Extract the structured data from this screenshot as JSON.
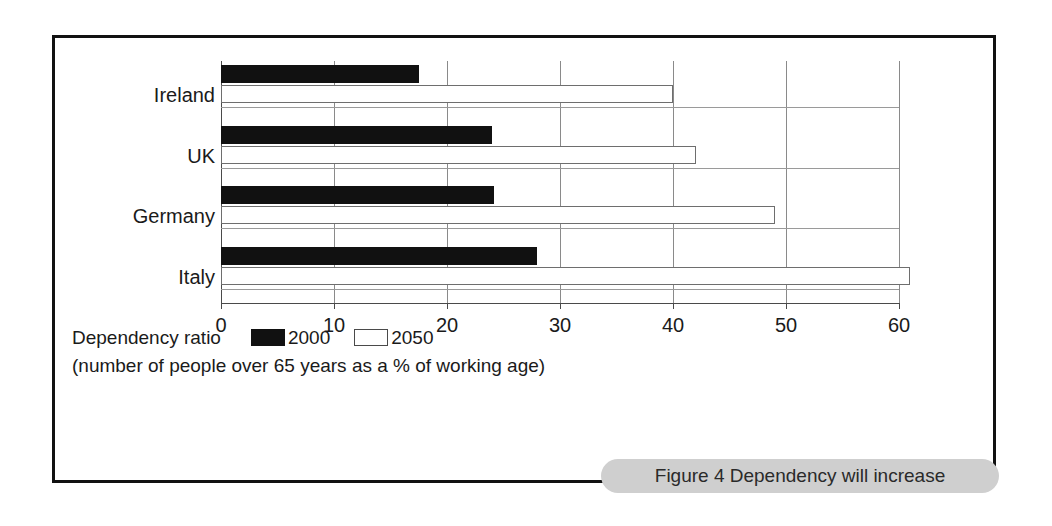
{
  "figure": {
    "caption": "Figure 4 Dependency will increase",
    "frame_color": "#111111",
    "caption_pill_color": "#cfcfcf"
  },
  "legend": {
    "title": "Dependency ratio",
    "note": "(number of people over 65 years as a % of working age)",
    "entries": [
      {
        "label": "2000",
        "swatch": "filled-black-swatch",
        "color": "#111111"
      },
      {
        "label": "2050",
        "swatch": "hollow-white-swatch",
        "color": "#ffffff"
      }
    ]
  },
  "chart_data": {
    "type": "bar",
    "orientation": "horizontal",
    "title": "Figure 4 Dependency will increase",
    "xlabel": "",
    "ylabel": "",
    "categories": [
      "Ireland",
      "UK",
      "Germany",
      "Italy"
    ],
    "series": [
      {
        "name": "2000",
        "color": "#111111",
        "values": [
          17.5,
          24,
          24.2,
          28
        ]
      },
      {
        "name": "2050",
        "color": "#ffffff",
        "values": [
          40,
          42,
          49,
          61
        ]
      }
    ],
    "xlim": [
      0,
      60
    ],
    "xticks": [
      0,
      10,
      20,
      30,
      40,
      50,
      60
    ],
    "xticklabels": [
      "0",
      "10",
      "20",
      "30",
      "40",
      "50",
      "60"
    ],
    "grid": true,
    "grid_axis": "x",
    "legend_position": "below-plot",
    "annotations": [
      "(number of people over 65 years as a % of working age)"
    ]
  }
}
